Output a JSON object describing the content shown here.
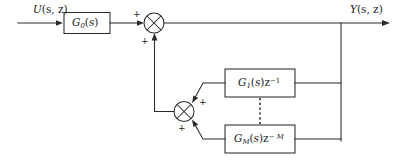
{
  "figure": {
    "type": "block-diagram",
    "title_visible": false,
    "background_color": "#ffffff",
    "line_color": "#2b2b2b"
  },
  "signals": {
    "input": {
      "label_plain": "U(s, z)",
      "base": "U",
      "args": "(s, z)"
    },
    "output": {
      "label_plain": "Y(s, z)",
      "base": "Y",
      "args": "(s, z)"
    }
  },
  "blocks": [
    {
      "id": "forward-block",
      "label_plain": "G0(s)",
      "base": "G",
      "subscript": "0",
      "args": "(s)",
      "delay": ""
    },
    {
      "id": "feedback-block-1",
      "label_plain": "G1(s)z^-1",
      "base": "G",
      "subscript": "1",
      "args": "(s)",
      "delay_base": "z",
      "delay_exp": "−1"
    },
    {
      "id": "feedback-block-m",
      "label_plain": "GM(s)z^-M",
      "base": "G",
      "subscript": "M",
      "args": "(s)",
      "delay_base": "z",
      "delay_exp": "− M"
    }
  ],
  "summing_junctions": [
    {
      "id": "sum-output",
      "signs": [
        "+",
        "+"
      ],
      "sign_top": "+",
      "sign_bottom": "+"
    },
    {
      "id": "sum-feedback",
      "signs": [
        "+",
        "+"
      ],
      "sign_top": "+",
      "sign_bottom": "+"
    }
  ],
  "ellipsis": {
    "id": "vertical-dotted-ellipsis",
    "meaning": "omitted intermediate feedback branches"
  }
}
